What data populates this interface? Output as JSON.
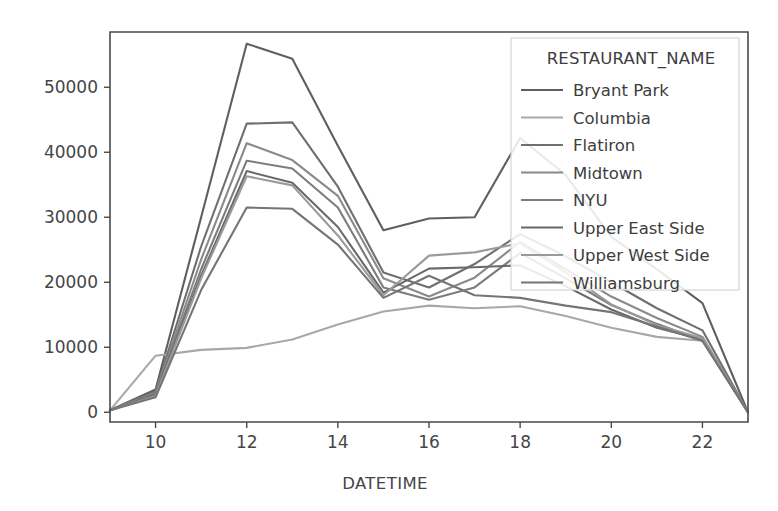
{
  "chart_data": {
    "type": "line",
    "title": "",
    "xlabel": "DATETIME",
    "ylabel": "",
    "xlim": [
      9,
      23
    ],
    "ylim": [
      -1500,
      58500
    ],
    "grid": false,
    "legend_position": "upper right",
    "legend_title": "RESTAURANT_NAME",
    "x_ticks": [
      10,
      12,
      14,
      16,
      18,
      20,
      22
    ],
    "y_ticks": [
      0,
      10000,
      20000,
      30000,
      40000,
      50000
    ],
    "x": [
      9,
      10,
      11,
      12,
      13,
      14,
      15,
      16,
      17,
      18,
      19,
      20,
      21,
      22,
      23
    ],
    "series": [
      {
        "name": "Bryant Park",
        "color": "#5f5f5f",
        "values": [
          300,
          3500,
          30000,
          56700,
          54400,
          41000,
          28000,
          29800,
          30000,
          42200,
          36500,
          27000,
          22000,
          16800,
          0
        ]
      },
      {
        "name": "Columbia",
        "color": "#a8a8a8",
        "values": [
          300,
          8700,
          9600,
          9900,
          11200,
          13500,
          15500,
          16400,
          16000,
          16300,
          14800,
          13000,
          11600,
          11000,
          0
        ]
      },
      {
        "name": "Flatiron",
        "color": "#6f6f6f",
        "values": [
          300,
          3200,
          25500,
          44400,
          44600,
          34700,
          21500,
          19200,
          22800,
          27400,
          24000,
          20000,
          16000,
          12600,
          0
        ]
      },
      {
        "name": "Midtown",
        "color": "#8a8a8a",
        "values": [
          300,
          3000,
          23500,
          41400,
          38800,
          33300,
          20600,
          17800,
          20700,
          26200,
          22000,
          17800,
          14500,
          11600,
          0
        ]
      },
      {
        "name": "NYU",
        "color": "#7c7c7c",
        "values": [
          300,
          2900,
          22000,
          38700,
          37500,
          31500,
          19200,
          17300,
          19200,
          24500,
          20600,
          16500,
          13600,
          11000,
          0
        ]
      },
      {
        "name": "Upper East Side",
        "color": "#696969",
        "values": [
          300,
          2700,
          21000,
          37100,
          35300,
          28500,
          18400,
          22100,
          22300,
          22600,
          19400,
          15800,
          13000,
          11200,
          0
        ]
      },
      {
        "name": "Upper West Side",
        "color": "#9a9a9a",
        "values": [
          300,
          2500,
          20600,
          36300,
          34900,
          27200,
          18000,
          24100,
          24600,
          26000,
          21500,
          16600,
          13400,
          11400,
          0
        ]
      },
      {
        "name": "Williamsburg",
        "color": "#757575",
        "values": [
          300,
          2300,
          18800,
          31500,
          31300,
          25800,
          17600,
          21000,
          18000,
          17600,
          16400,
          15400,
          13200,
          11000,
          0
        ]
      }
    ]
  }
}
